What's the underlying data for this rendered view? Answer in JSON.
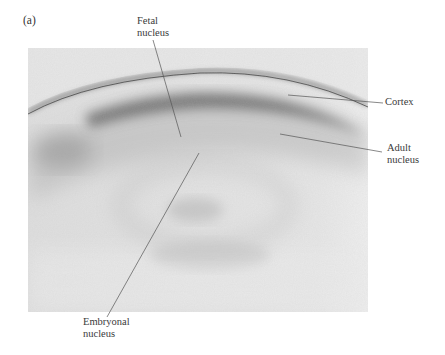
{
  "figure": {
    "panel_label": "(a)",
    "background_color": "#ffffff",
    "photo_bg_color": "#e4e4e4",
    "labels": {
      "fetal_nucleus": "Fetal\nnucleus",
      "cortex": "Cortex",
      "adult_nucleus": "Adult\nnucleus",
      "embryonal_nucleus": "Embryonal\nnucleus"
    }
  }
}
